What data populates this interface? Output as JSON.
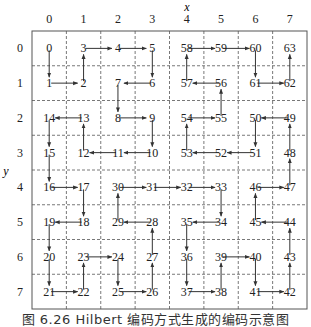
{
  "figure": {
    "x_axis_label": "x",
    "y_axis_label": "y",
    "column_labels": [
      "0",
      "1",
      "2",
      "3",
      "4",
      "5",
      "6",
      "7"
    ],
    "row_labels": [
      "0",
      "1",
      "2",
      "3",
      "4",
      "5",
      "6",
      "7"
    ],
    "caption": "图 6.26   Hilbert 编码方式生成的编码示意图"
  },
  "hilbert": {
    "grid_size": 8,
    "order": [
      [
        0,
        0
      ],
      [
        0,
        1
      ],
      [
        1,
        1
      ],
      [
        1,
        0
      ],
      [
        2,
        0
      ],
      [
        3,
        0
      ],
      [
        3,
        1
      ],
      [
        2,
        1
      ],
      [
        2,
        2
      ],
      [
        3,
        2
      ],
      [
        3,
        3
      ],
      [
        2,
        3
      ],
      [
        1,
        3
      ],
      [
        1,
        2
      ],
      [
        0,
        2
      ],
      [
        0,
        3
      ],
      [
        0,
        4
      ],
      [
        1,
        4
      ],
      [
        1,
        5
      ],
      [
        0,
        5
      ],
      [
        0,
        6
      ],
      [
        0,
        7
      ],
      [
        1,
        7
      ],
      [
        1,
        6
      ],
      [
        2,
        6
      ],
      [
        2,
        7
      ],
      [
        3,
        7
      ],
      [
        3,
        6
      ],
      [
        3,
        5
      ],
      [
        2,
        5
      ],
      [
        2,
        4
      ],
      [
        3,
        4
      ],
      [
        4,
        4
      ],
      [
        5,
        4
      ],
      [
        5,
        5
      ],
      [
        4,
        5
      ],
      [
        4,
        6
      ],
      [
        4,
        7
      ],
      [
        5,
        7
      ],
      [
        5,
        6
      ],
      [
        6,
        6
      ],
      [
        6,
        7
      ],
      [
        7,
        7
      ],
      [
        7,
        6
      ],
      [
        7,
        5
      ],
      [
        6,
        5
      ],
      [
        6,
        4
      ],
      [
        7,
        4
      ],
      [
        7,
        3
      ],
      [
        7,
        2
      ],
      [
        6,
        2
      ],
      [
        6,
        3
      ],
      [
        5,
        3
      ],
      [
        4,
        3
      ],
      [
        4,
        2
      ],
      [
        5,
        2
      ],
      [
        5,
        1
      ],
      [
        4,
        1
      ],
      [
        4,
        0
      ],
      [
        5,
        0
      ],
      [
        6,
        0
      ],
      [
        6,
        1
      ],
      [
        7,
        1
      ],
      [
        7,
        0
      ]
    ]
  },
  "colors": {
    "line": "#333333",
    "grid": "#555555",
    "text": "#222222"
  }
}
